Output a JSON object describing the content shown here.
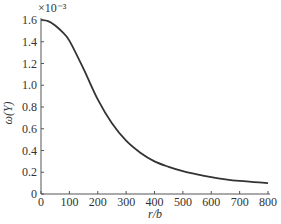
{
  "chart_data": {
    "type": "line",
    "title": "",
    "xlabel": "r/b",
    "ylabel": "ω(Y)",
    "y_multiplier": "×10⁻³",
    "xlim": [
      0,
      800
    ],
    "ylim": [
      0,
      1.6
    ],
    "grid": false,
    "legend": null,
    "x_ticks": [
      "0",
      "100",
      "200",
      "300",
      "400",
      "500",
      "600",
      "700",
      "800"
    ],
    "y_ticks": [
      "0",
      "0.2",
      "0.4",
      "0.6",
      "0.8",
      "1.0",
      "1.2",
      "1.4",
      "1.6"
    ],
    "series": [
      {
        "name": "ω(Y)",
        "color": "#333333",
        "x": [
          0,
          25,
          50,
          75,
          100,
          150,
          200,
          250,
          300,
          350,
          400,
          450,
          500,
          550,
          600,
          650,
          700,
          750,
          800
        ],
        "values": [
          1.6,
          1.59,
          1.55,
          1.49,
          1.41,
          1.15,
          0.87,
          0.65,
          0.49,
          0.38,
          0.3,
          0.25,
          0.21,
          0.18,
          0.155,
          0.135,
          0.12,
          0.11,
          0.1
        ]
      }
    ]
  }
}
